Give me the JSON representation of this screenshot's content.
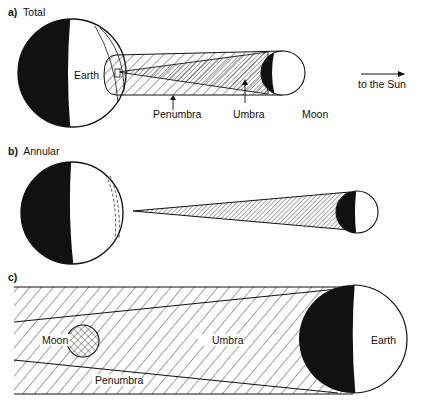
{
  "panels": {
    "a": {
      "letter": "a)",
      "title": "Total",
      "labels": {
        "earth": "Earth",
        "penumbra": "Penumbra",
        "umbra": "Umbra",
        "moon": "Moon",
        "sun_direction": "to the Sun"
      }
    },
    "b": {
      "letter": "b)",
      "title": "Annular"
    },
    "c": {
      "letter": "c)",
      "labels": {
        "moon": "Moon",
        "umbra": "Umbra",
        "earth": "Earth",
        "penumbra": "Penumbra"
      }
    }
  },
  "colors": {
    "ink": "#111111",
    "paper": "#ffffff"
  }
}
